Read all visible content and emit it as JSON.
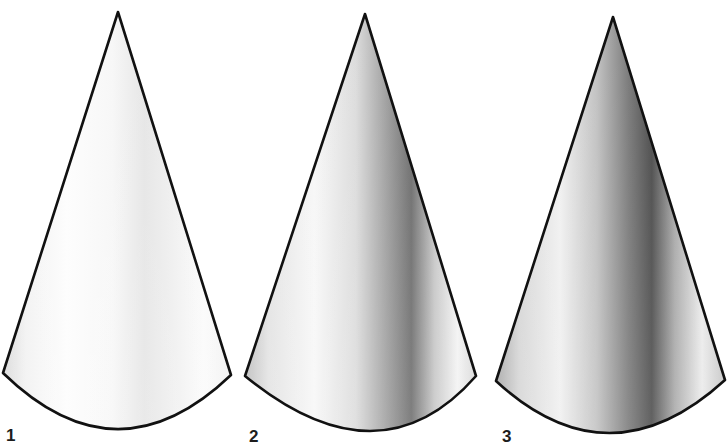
{
  "figure": {
    "background": "#ffffff",
    "outline_color": "#111111",
    "cones": [
      {
        "label": "1",
        "shading": "light",
        "apex": [
          118,
          12
        ],
        "base_left": [
          3,
          373
        ],
        "base_right": [
          231,
          375
        ],
        "base_bottom": [
          117,
          429
        ],
        "label_pos": [
          6,
          427
        ],
        "gradient": [
          {
            "offset": "0%",
            "color": "#d9d9d9"
          },
          {
            "offset": "10%",
            "color": "#f2f2f2"
          },
          {
            "offset": "28%",
            "color": "#fdfdfd"
          },
          {
            "offset": "48%",
            "color": "#f7f7f7"
          },
          {
            "offset": "62%",
            "color": "#e6e6e6"
          },
          {
            "offset": "74%",
            "color": "#efefef"
          },
          {
            "offset": "88%",
            "color": "#fbfbfb"
          },
          {
            "offset": "100%",
            "color": "#f1f1f1"
          }
        ]
      },
      {
        "label": "2",
        "shading": "medium",
        "apex": [
          365,
          14
        ],
        "base_left": [
          245,
          376
        ],
        "base_right": [
          476,
          376
        ],
        "base_bottom": [
          370,
          431
        ],
        "label_pos": [
          249,
          428
        ],
        "gradient": [
          {
            "offset": "0%",
            "color": "#bdbdbd"
          },
          {
            "offset": "10%",
            "color": "#e3e3e3"
          },
          {
            "offset": "30%",
            "color": "#f7f7f7"
          },
          {
            "offset": "48%",
            "color": "#dcdcdc"
          },
          {
            "offset": "62%",
            "color": "#9c9c9c"
          },
          {
            "offset": "72%",
            "color": "#6e6e6e"
          },
          {
            "offset": "82%",
            "color": "#c7c7c7"
          },
          {
            "offset": "92%",
            "color": "#f3f3f3"
          },
          {
            "offset": "100%",
            "color": "#d8d8d8"
          }
        ]
      },
      {
        "label": "3",
        "shading": "dark",
        "apex": [
          613,
          17
        ],
        "base_left": [
          496,
          381
        ],
        "base_right": [
          725,
          380
        ],
        "base_bottom": [
          610,
          433
        ],
        "label_pos": [
          502,
          428
        ],
        "gradient": [
          {
            "offset": "0%",
            "color": "#a8a8a8"
          },
          {
            "offset": "10%",
            "color": "#d6d6d6"
          },
          {
            "offset": "28%",
            "color": "#f0f0f0"
          },
          {
            "offset": "44%",
            "color": "#c2c2c2"
          },
          {
            "offset": "58%",
            "color": "#7a7a7a"
          },
          {
            "offset": "68%",
            "color": "#4d4d4d"
          },
          {
            "offset": "78%",
            "color": "#a9a9a9"
          },
          {
            "offset": "90%",
            "color": "#ebebeb"
          },
          {
            "offset": "100%",
            "color": "#c4c4c4"
          }
        ]
      }
    ]
  }
}
